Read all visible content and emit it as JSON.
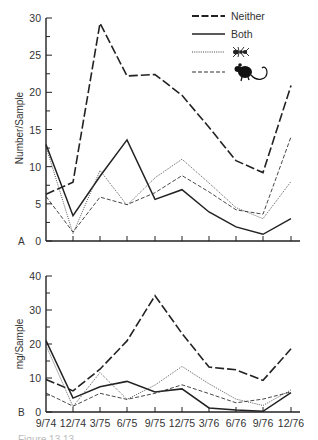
{
  "chart_data": [
    {
      "type": "line",
      "panel": "A",
      "title": "",
      "xlabel": "",
      "ylabel": "Number/Sample",
      "ylim": [
        0,
        30
      ],
      "yticks": [
        0,
        5,
        10,
        15,
        20,
        25,
        30
      ],
      "categories": [
        "9/74",
        "12/74",
        "3/75",
        "6/75",
        "9/75",
        "12/75",
        "3/76",
        "6/76",
        "9/76",
        "12/76"
      ],
      "grid": false,
      "legend_position": "upper right",
      "series": [
        {
          "name": "Neither",
          "style": "long-dash",
          "values": [
            6.3,
            7.9,
            29.3,
            22.2,
            22.4,
            19.6,
            15.3,
            10.8,
            9.2,
            20.9
          ]
        },
        {
          "name": "Both",
          "style": "solid",
          "values": [
            13.0,
            3.4,
            8.7,
            13.6,
            5.6,
            6.9,
            3.9,
            1.9,
            0.9,
            3.0
          ]
        },
        {
          "name": "Ants (ant icon)",
          "style": "dotted",
          "values": [
            12.7,
            1.0,
            9.5,
            4.8,
            8.5,
            11.0,
            7.8,
            4.5,
            3.0,
            8.0
          ]
        },
        {
          "name": "Rodents (rodent icon)",
          "style": "short-dash",
          "values": [
            6.0,
            1.2,
            5.9,
            4.9,
            6.5,
            8.8,
            6.6,
            4.2,
            3.6,
            14.0
          ]
        }
      ]
    },
    {
      "type": "line",
      "panel": "B",
      "title": "",
      "xlabel": "",
      "ylabel": "mg/Sample",
      "ylim": [
        0,
        40
      ],
      "yticks": [
        0,
        10,
        20,
        30,
        40
      ],
      "categories": [
        "9/74",
        "12/74",
        "3/75",
        "6/75",
        "9/75",
        "12/75",
        "3/76",
        "6/76",
        "9/76",
        "12/76"
      ],
      "grid": false,
      "series": [
        {
          "name": "Neither",
          "style": "long-dash",
          "values": [
            9.6,
            6.2,
            12.6,
            20.9,
            34.2,
            23.1,
            13.2,
            12.4,
            9.3,
            18.6
          ]
        },
        {
          "name": "Both",
          "style": "solid",
          "values": [
            21.0,
            4.1,
            7.4,
            9.0,
            5.9,
            6.8,
            1.2,
            0.6,
            0.2,
            5.7
          ]
        },
        {
          "name": "Ants (ant icon)",
          "style": "dotted",
          "values": [
            19.6,
            1.6,
            11.6,
            3.7,
            7.9,
            13.4,
            8.3,
            3.8,
            1.9,
            6.5
          ]
        },
        {
          "name": "Rodents (rodent icon)",
          "style": "short-dash",
          "values": [
            5.6,
            1.7,
            5.5,
            3.7,
            5.5,
            8.0,
            5.4,
            2.7,
            3.8,
            5.9
          ]
        }
      ]
    }
  ],
  "legend": {
    "items": [
      {
        "label": "Neither",
        "style": "long-dash"
      },
      {
        "label": "Both",
        "style": "solid"
      },
      {
        "label": "",
        "icon": "ant-icon",
        "style": "dotted"
      },
      {
        "label": "",
        "icon": "rodent-icon",
        "style": "short-dash"
      }
    ]
  },
  "panels": {
    "a": {
      "letter": "A",
      "ylabel": "Number/Sample"
    },
    "b": {
      "letter": "B",
      "ylabel": "mg/Sample"
    }
  },
  "caption": {
    "text": "Figure 13.13 ..."
  }
}
